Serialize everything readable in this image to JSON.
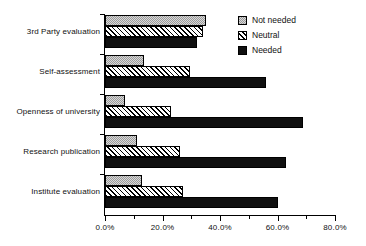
{
  "chart_data": {
    "type": "bar",
    "orientation": "horizontal",
    "title": "",
    "subtitle": "",
    "xlabel": "",
    "ylabel": "",
    "xlim": [
      0,
      80
    ],
    "xticks": [
      0,
      10,
      20,
      30,
      40,
      50,
      60,
      70,
      80
    ],
    "xtick_labels": [
      "0.0%",
      "",
      "20.0%",
      "",
      "40.0%",
      "",
      "60.0%",
      "",
      "80.0%"
    ],
    "major_xticks": [
      0,
      20,
      40,
      60,
      80
    ],
    "major_xtick_labels": [
      "0.0%",
      "20.0%",
      "40.0%",
      "60.0%",
      "80.0%"
    ],
    "grid": false,
    "legend_position": "top-right",
    "categories": [
      "3rd Party evaluation",
      "Self-assessment",
      "Openness of university",
      "Research publication",
      "Institute evaluation"
    ],
    "series": [
      {
        "name": "Not needed",
        "color": "#9a9a9a",
        "pattern": "dotted-gray",
        "values": [
          35.0,
          13.5,
          7.0,
          11.0,
          13.0
        ]
      },
      {
        "name": "Neutral",
        "color": "#ffffff",
        "pattern": "diagonal-hatch",
        "values": [
          34.0,
          29.5,
          23.0,
          26.0,
          27.0
        ]
      },
      {
        "name": "Needed",
        "color": "#101010",
        "pattern": "solid-black",
        "values": [
          32.0,
          56.0,
          69.0,
          63.0,
          60.0
        ]
      }
    ]
  },
  "legend": {
    "items": [
      {
        "label": "Not needed"
      },
      {
        "label": "Neutral"
      },
      {
        "label": "Needed"
      }
    ]
  }
}
